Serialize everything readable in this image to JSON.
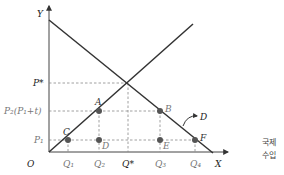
{
  "diagram": {
    "axes": {
      "y_label": "Y",
      "x_label": "X",
      "origin_label": "O"
    },
    "price_labels": {
      "p_star": "P*",
      "p2": "P₂(P₁+t)",
      "p1": "P₁"
    },
    "quantity_labels": {
      "q1": "Q₁",
      "q2": "Q₂",
      "q_star": "Q*",
      "q3": "Q₃",
      "q4": "Q₄"
    },
    "points": {
      "A": "A",
      "B": "B",
      "C": "C",
      "D": "D",
      "E": "E",
      "F": "F"
    },
    "curve_label": "D",
    "side_note": {
      "line1": "국제",
      "line2": "수입"
    },
    "colors": {
      "line": "#333333",
      "dashed": "#888888",
      "point": "#555555"
    }
  }
}
